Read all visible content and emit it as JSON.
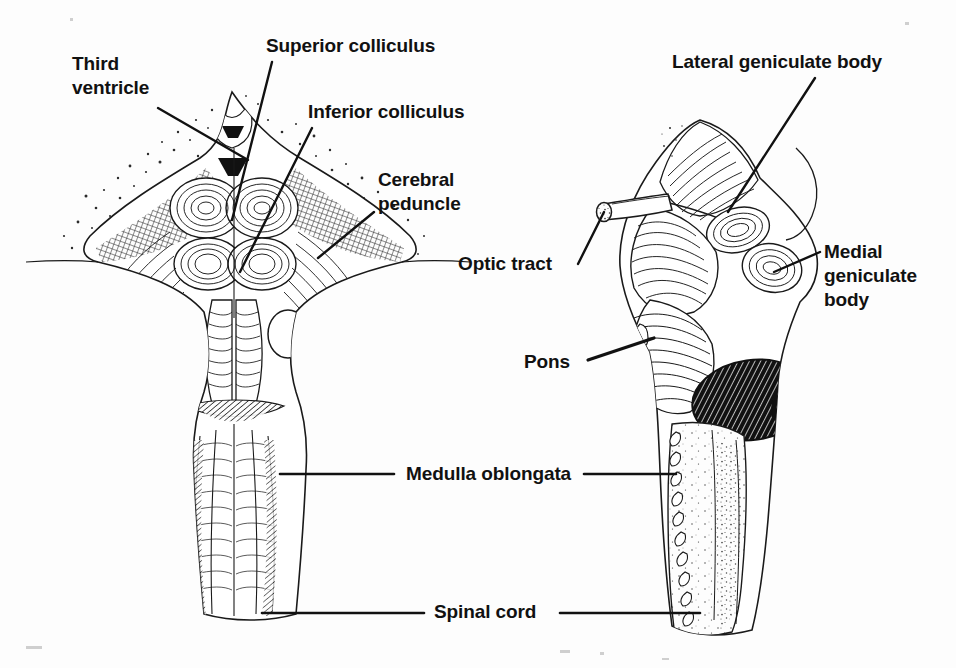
{
  "figure": {
    "medium": "pen-and-ink line drawing",
    "background_color": "#fdfdfd",
    "ink_color": "#111111",
    "views": [
      {
        "name": "dorsal-view",
        "position": "left"
      },
      {
        "name": "lateral-view",
        "position": "right"
      }
    ]
  },
  "labels": [
    {
      "id": "third-ventricle",
      "text_lines": [
        "Third",
        "ventricle"
      ],
      "text": "Third ventricle",
      "x": 72,
      "y": 52,
      "align": "left",
      "leader": [
        [
          158,
          108
        ],
        [
          248,
          160
        ]
      ]
    },
    {
      "id": "superior-colliculus",
      "text_lines": [
        "Superior colliculus"
      ],
      "text": "Superior colliculus",
      "x": 266,
      "y": 34,
      "align": "left",
      "leader": [
        [
          272,
          62
        ],
        [
          232,
          220
        ]
      ]
    },
    {
      "id": "inferior-colliculus",
      "text_lines": [
        "Inferior colliculus"
      ],
      "text": "Inferior colliculus",
      "x": 308,
      "y": 100,
      "align": "left",
      "leader": [
        [
          312,
          128
        ],
        [
          240,
          272
        ]
      ]
    },
    {
      "id": "cerebral-peduncle",
      "text_lines": [
        "Cerebral",
        "peduncle"
      ],
      "text": "Cerebral peduncle",
      "x": 378,
      "y": 168,
      "align": "left",
      "leader": [
        [
          374,
          212
        ],
        [
          318,
          258
        ]
      ]
    },
    {
      "id": "lateral-geniculate-body",
      "text_lines": [
        "Lateral geniculate body"
      ],
      "text": "Lateral geniculate body",
      "x": 672,
      "y": 50,
      "align": "left",
      "leader": [
        [
          815,
          78
        ],
        [
          728,
          212
        ]
      ]
    },
    {
      "id": "medial-geniculate-body",
      "text_lines": [
        "Medial",
        "geniculate",
        "body"
      ],
      "text": "Medial geniculate body",
      "x": 824,
      "y": 240,
      "align": "left",
      "leader": [
        [
          820,
          252
        ],
        [
          774,
          272
        ]
      ]
    },
    {
      "id": "optic-tract",
      "text_lines": [
        "Optic tract"
      ],
      "text": "Optic tract",
      "x": 458,
      "y": 252,
      "align": "left",
      "leader": [
        [
          578,
          264
        ],
        [
          604,
          210
        ]
      ]
    },
    {
      "id": "pons",
      "text_lines": [
        "Pons"
      ],
      "text": "Pons",
      "x": 524,
      "y": 350,
      "align": "left",
      "leader": [
        [
          588,
          360
        ],
        [
          652,
          340
        ]
      ]
    },
    {
      "id": "medulla-oblongata",
      "text_lines": [
        "Medulla oblongata"
      ],
      "text": "Medulla oblongata",
      "x": 406,
      "y": 465,
      "align": "left",
      "leader_left": [
        [
          394,
          474
        ],
        [
          280,
          474
        ]
      ],
      "leader_right": [
        [
          584,
          474
        ],
        [
          672,
          474
        ]
      ]
    },
    {
      "id": "spinal-cord",
      "text_lines": [
        "Spinal cord"
      ],
      "text": "Spinal cord",
      "x": 434,
      "y": 602,
      "align": "left",
      "leader_left": [
        [
          424,
          613
        ],
        [
          262,
          613
        ]
      ],
      "leader_right": [
        [
          560,
          613
        ],
        [
          700,
          613
        ]
      ]
    }
  ]
}
